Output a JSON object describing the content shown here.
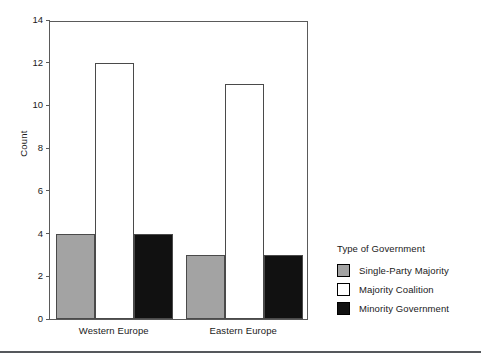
{
  "chart_data": {
    "type": "bar",
    "title": "",
    "xlabel": "",
    "ylabel": "Count",
    "ylim": [
      0,
      14
    ],
    "yticks": [
      0,
      2,
      4,
      6,
      8,
      10,
      12,
      14
    ],
    "grid": false,
    "legend_position": "right",
    "legend_title": "Type of Government",
    "categories": [
      "Western Europe",
      "Eastern Europe"
    ],
    "series": [
      {
        "name": "Single-Party Majority",
        "color": "#a3a3a3",
        "values": [
          4,
          3
        ]
      },
      {
        "name": "Majority Coalition",
        "color": "#ffffff",
        "values": [
          12,
          11
        ]
      },
      {
        "name": "Minority Government",
        "color": "#111111",
        "values": [
          4,
          3
        ]
      }
    ]
  },
  "axes": {
    "y_title": "Count",
    "tick_labels": [
      "0",
      "2",
      "4",
      "6",
      "8",
      "10",
      "12",
      "14"
    ]
  },
  "legend": {
    "title": "Type of Government",
    "entries": [
      {
        "label": "Single-Party Majority",
        "color": "#a3a3a3"
      },
      {
        "label": "Majority Coalition",
        "color": "#ffffff"
      },
      {
        "label": "Minority Government",
        "color": "#111111"
      }
    ]
  },
  "colors": {
    "axis": "#5a5a5a",
    "bar_border": "#4a4a4a",
    "text": "#1a1a1a",
    "footer_rule": "#55585c",
    "background": "#ffffff"
  }
}
